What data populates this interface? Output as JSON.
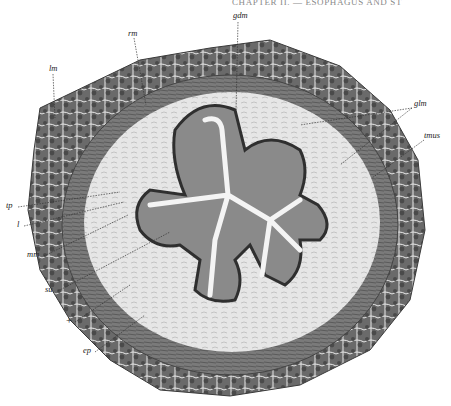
{
  "header": {
    "running_title": "CHAPTER II. — ESOPHAGUS AND ST"
  },
  "figure": {
    "labels": [
      {
        "id": "gdm",
        "text": "gdm",
        "x": 233,
        "y": 16
      },
      {
        "id": "rm",
        "text": "rm",
        "x": 128,
        "y": 33
      },
      {
        "id": "lm",
        "text": "lm",
        "x": 51,
        "y": 68
      },
      {
        "id": "glm",
        "text": "glm",
        "x": 415,
        "y": 104
      },
      {
        "id": "tmus",
        "text": "tmus",
        "x": 427,
        "y": 134
      },
      {
        "id": "tp",
        "text": "tp",
        "x": 7,
        "y": 205
      },
      {
        "id": "l",
        "text": "l",
        "x": 17,
        "y": 224
      },
      {
        "id": "mm",
        "text": "mm",
        "x": 29,
        "y": 254
      },
      {
        "id": "su",
        "text": "su",
        "x": 46,
        "y": 289
      },
      {
        "id": "plus",
        "text": "+",
        "x": 67,
        "y": 321
      },
      {
        "id": "ep",
        "text": "ep",
        "x": 83,
        "y": 350
      }
    ]
  },
  "colors": {
    "muscle": "#5e5e5e",
    "muscle_dark": "#3c3c3c",
    "submucosa": "#dcdcdc",
    "epithelium": "#4a4a4a",
    "lumen": "#f2f2f2",
    "ink": "#222222"
  }
}
